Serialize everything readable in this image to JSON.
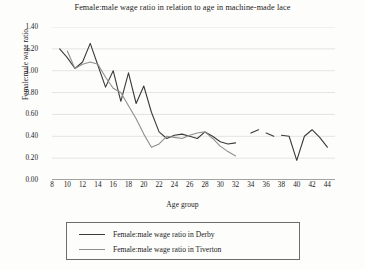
{
  "chart_data": {
    "type": "line",
    "title": "Female:male wage ratio in relation to age in machine-made lace",
    "xlabel": "Age group",
    "ylabel": "Female:male wage ratio",
    "xlim": [
      8,
      45
    ],
    "ylim": [
      0.0,
      1.4
    ],
    "ytick_labels": [
      "0.00",
      "0.20",
      "0.40",
      "0.60",
      "0.80",
      "1.00",
      "1.20",
      "1.40"
    ],
    "ytick_values": [
      0.0,
      0.2,
      0.4,
      0.6,
      0.8,
      1.0,
      1.2,
      1.4
    ],
    "xtick_labels": [
      "8",
      "10",
      "12",
      "14",
      "16",
      "18",
      "20",
      "22",
      "24",
      "26",
      "28",
      "30",
      "32",
      "34",
      "36",
      "38",
      "40",
      "42",
      "44"
    ],
    "xtick_values": [
      8,
      10,
      12,
      14,
      16,
      18,
      20,
      22,
      24,
      26,
      28,
      30,
      32,
      34,
      36,
      38,
      40,
      42,
      44
    ],
    "grid": "horizontal",
    "legend_position": "below-plot",
    "series": [
      {
        "name": "Female:male wage ratio in Derby",
        "color": "#3a3a3a",
        "x": [
          9,
          10,
          11,
          12,
          13,
          14,
          15,
          16,
          17,
          18,
          19,
          20,
          21,
          22,
          23,
          24,
          25,
          26,
          27,
          28,
          29,
          30,
          31,
          32
        ],
        "values": [
          1.2,
          1.12,
          1.02,
          1.08,
          1.25,
          1.05,
          0.85,
          1.0,
          0.72,
          0.98,
          0.7,
          0.86,
          0.62,
          0.44,
          0.38,
          0.41,
          0.42,
          0.4,
          0.38,
          0.44,
          0.4,
          0.35,
          0.33,
          0.34
        ],
        "segments": [
          {
            "x": [
              34,
              35
            ],
            "values": [
              0.43,
              0.46
            ]
          },
          {
            "x": [
              36,
              37
            ],
            "values": [
              0.43,
              0.4
            ]
          },
          {
            "x": [
              38,
              39,
              40,
              41,
              42,
              43,
              44
            ],
            "values": [
              0.41,
              0.4,
              0.18,
              0.4,
              0.46,
              0.39,
              0.3
            ]
          }
        ]
      },
      {
        "name": "Female:male wage ratio in Tiverton",
        "color": "#8f8f8f",
        "x": [
          10,
          11,
          12,
          13,
          14,
          15,
          16,
          17,
          18,
          19,
          20,
          21,
          22,
          23,
          24,
          25,
          26,
          27,
          28,
          29,
          30,
          31,
          32
        ],
        "values": [
          1.18,
          1.02,
          1.06,
          1.08,
          1.06,
          0.94,
          0.84,
          0.8,
          0.68,
          0.56,
          0.42,
          0.3,
          0.33,
          0.4,
          0.39,
          0.38,
          0.41,
          0.43,
          0.44,
          0.38,
          0.31,
          0.26,
          0.22
        ]
      }
    ]
  },
  "legend": {
    "entries": [
      {
        "label": "Female:male wage ratio in Derby"
      },
      {
        "label": "Female:male wage ratio in Tiverton"
      }
    ]
  }
}
